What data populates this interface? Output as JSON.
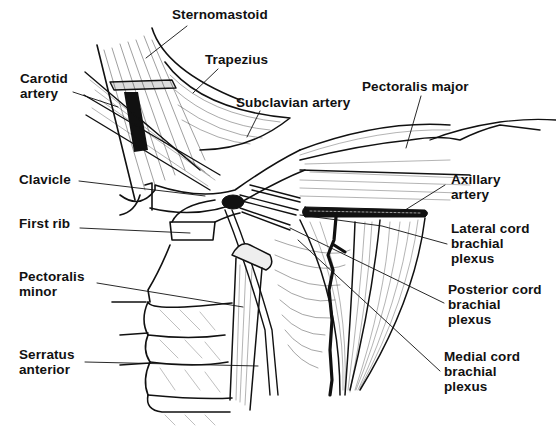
{
  "diagram": {
    "colors": {
      "ink": "#111111",
      "background": "#ffffff"
    },
    "labels": [
      {
        "id": "sternomastoid",
        "text": "Sternomastoid",
        "x": 172,
        "y": 7
      },
      {
        "id": "trapezius",
        "text": "Trapezius",
        "x": 205,
        "y": 52
      },
      {
        "id": "carotid-artery",
        "text": "Carotid\nartery",
        "x": 20,
        "y": 71
      },
      {
        "id": "subclavian-artery",
        "text": "Subclavian artery",
        "x": 236,
        "y": 95
      },
      {
        "id": "pectoralis-major",
        "text": "Pectoralis major",
        "x": 362,
        "y": 79
      },
      {
        "id": "clavicle",
        "text": "Clavicle",
        "x": 19,
        "y": 172
      },
      {
        "id": "axillary-artery",
        "text": "Axillary\nartery",
        "x": 451,
        "y": 172
      },
      {
        "id": "first-rib",
        "text": "First rib",
        "x": 19,
        "y": 216
      },
      {
        "id": "lateral-cord",
        "text": "Lateral cord\nbrachial\nplexus",
        "x": 451,
        "y": 221
      },
      {
        "id": "pectoralis-minor",
        "text": "Pectoralis\nminor",
        "x": 19,
        "y": 269
      },
      {
        "id": "posterior-cord",
        "text": "Posterior cord\nbrachial\nplexus",
        "x": 448,
        "y": 282
      },
      {
        "id": "medial-cord",
        "text": "Medial cord\nbrachial\nplexus",
        "x": 444,
        "y": 349
      },
      {
        "id": "serratus-anterior",
        "text": "Serratus\nanterior",
        "x": 19,
        "y": 347
      }
    ]
  }
}
